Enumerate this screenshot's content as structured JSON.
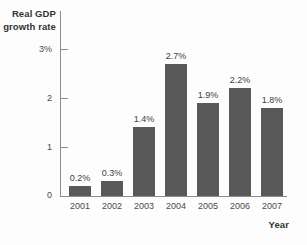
{
  "chart_data": {
    "type": "bar",
    "title": "",
    "xlabel": "Year",
    "ylabel": "Real GDP growth rate",
    "ylabel_lines": [
      "Real GDP",
      "growth rate"
    ],
    "categories": [
      "2001",
      "2002",
      "2003",
      "2004",
      "2005",
      "2006",
      "2007"
    ],
    "values": [
      0.2,
      0.3,
      1.4,
      2.7,
      1.9,
      2.2,
      1.8
    ],
    "data_labels": [
      "0.2%",
      "0.3%",
      "1.4%",
      "2.7%",
      "1.9%",
      "2.2%",
      "1.8%"
    ],
    "ylim": [
      0,
      3
    ],
    "yticks": [
      0,
      1,
      2,
      3
    ],
    "ytick_labels": [
      "0",
      "1",
      "2",
      "3%"
    ],
    "grid": false,
    "legend": null,
    "bar_color": "#595959",
    "axis_color": "#8d8d8d",
    "text_color": "#3a3a3a",
    "background_color": "#fdfdfd"
  }
}
